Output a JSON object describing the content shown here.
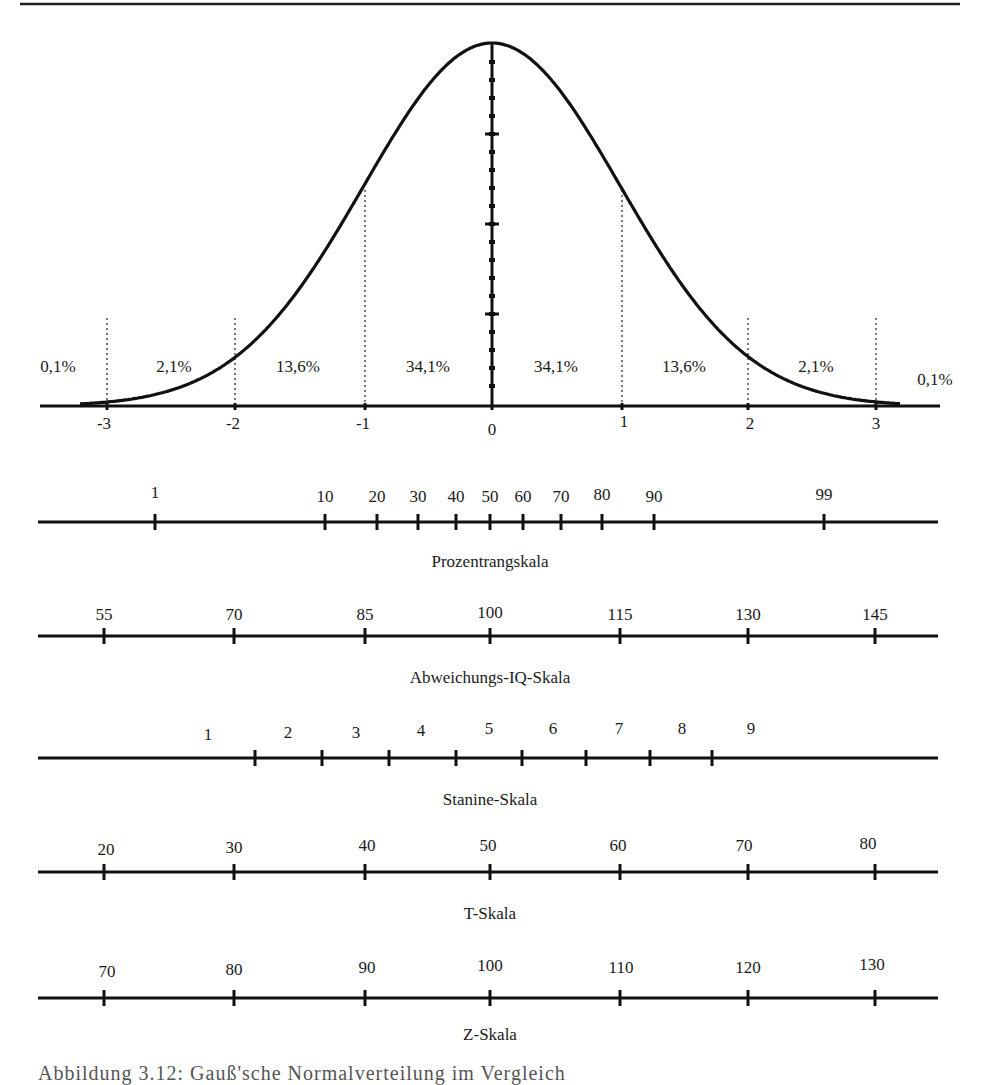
{
  "chart_data": [
    {
      "type": "line",
      "title": "Gaußsche Normalverteilung",
      "xlabel": "",
      "ylabel": "",
      "x_ticks": [
        "-3",
        "-2",
        "-1",
        "0",
        "1",
        "2",
        "3"
      ],
      "x_range": [
        -3.5,
        3.5
      ],
      "curve": "standard normal density",
      "area_labels": [
        "0,1%",
        "2,1%",
        "13,6%",
        "34,1%",
        "34,1%",
        "13,6%",
        "2,1%",
        "0,1%"
      ],
      "area_percentages": [
        0.1,
        2.1,
        13.6,
        34.1,
        34.1,
        13.6,
        2.1,
        0.1
      ],
      "grid": false,
      "vertical_dotted_lines_at": [
        -3,
        -2,
        -1,
        1,
        2,
        3
      ]
    },
    {
      "type": "table",
      "scales": [
        {
          "name": "Prozentrangskala",
          "ticks": [
            "1",
            "10",
            "20",
            "30",
            "40",
            "50",
            "60",
            "70",
            "80",
            "90",
            "99"
          ]
        },
        {
          "name": "Abweichungs-IQ-Skala",
          "ticks": [
            "55",
            "70",
            "85",
            "100",
            "115",
            "130",
            "145"
          ]
        },
        {
          "name": "Stanine-Skala",
          "ticks": [
            "1",
            "2",
            "3",
            "4",
            "5",
            "6",
            "7",
            "8",
            "9"
          ]
        },
        {
          "name": "T-Skala",
          "ticks": [
            "20",
            "30",
            "40",
            "50",
            "60",
            "70",
            "80"
          ]
        },
        {
          "name": "Z-Skala",
          "ticks": [
            "70",
            "80",
            "90",
            "100",
            "110",
            "120",
            "130"
          ]
        }
      ]
    }
  ],
  "curve": {
    "percent_labels": [
      "0,1%",
      "2,1%",
      "13,6%",
      "34,1%",
      "34,1%",
      "13,6%",
      "2,1%",
      "0,1%"
    ],
    "z_ticks": [
      "-3",
      "-2",
      "-1",
      "0",
      "1",
      "2",
      "3"
    ]
  },
  "scales": {
    "prozentrang": {
      "title": "Prozentrangskala",
      "ticks": [
        "1",
        "10",
        "20",
        "30",
        "40",
        "50",
        "60",
        "70",
        "80",
        "90",
        "99"
      ]
    },
    "iq": {
      "title": "Abweichungs-IQ-Skala",
      "ticks": [
        "55",
        "70",
        "85",
        "100",
        "115",
        "130",
        "145"
      ]
    },
    "stanine": {
      "title": "Stanine-Skala",
      "ticks": [
        "1",
        "2",
        "3",
        "4",
        "5",
        "6",
        "7",
        "8",
        "9"
      ]
    },
    "t": {
      "title": "T-Skala",
      "ticks": [
        "20",
        "30",
        "40",
        "50",
        "60",
        "70",
        "80"
      ]
    },
    "z": {
      "title": "Z-Skala",
      "ticks": [
        "70",
        "80",
        "90",
        "100",
        "110",
        "120",
        "130"
      ]
    }
  },
  "caption": "Abbildung 3.12: Gauß'sche Normalverteilung im Vergleich"
}
